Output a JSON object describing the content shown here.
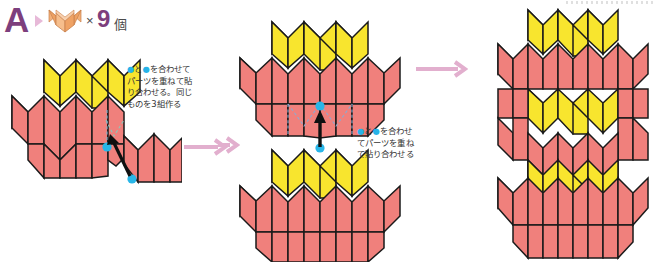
{
  "header": {
    "step_letter": "A",
    "arrow_icon": "triangle-right-icon",
    "unit_icon": "origami-unit-orange-icon",
    "multiply_sign": "×",
    "count": "9",
    "counter_suffix": "個"
  },
  "panels": [
    {
      "id": "panel-1",
      "name": "step-1-diagram",
      "description": "Three units joined: one yellow unit row overlapped on red units, with a loose red unit to the right",
      "callout": {
        "lines": [
          "●と●を合わせて",
          "パーツを重ねて貼",
          "り合わせる。同じ",
          "ものを 3 組作る"
        ],
        "full_text": "●と●を合わせてパーツを重ねて貼り合わせる。同じものを3組作る"
      },
      "markers": {
        "dot_color": "#29b6e8",
        "dot_count": 2,
        "assembly_arrow": "black-assembly-arrow"
      }
    },
    {
      "id": "panel-2",
      "name": "step-2-diagram",
      "description": "Two identical assembled groups stacked vertically, joined by a black arrow between two cyan dots",
      "callout": {
        "lines": [
          "●と●を合わせ",
          "てパーツを重ね",
          "て貼り合わせる"
        ],
        "full_text": "●と●を合わせてパーツを重ねて貼り合わせる"
      },
      "markers": {
        "dot_color": "#29b6e8",
        "dot_count": 2,
        "assembly_arrow": "black-assembly-arrow"
      }
    },
    {
      "id": "panel-3",
      "name": "step-3-result-diagram",
      "description": "Completed larger assembly of yellow and red units",
      "callout": null,
      "markers": null
    }
  ],
  "flow_arrows": [
    {
      "name": "flow-arrow-1",
      "direction": "right"
    },
    {
      "name": "flow-arrow-2",
      "direction": "right"
    },
    {
      "name": "flow-arrow-3",
      "direction": "right"
    }
  ],
  "colors": {
    "yellow_unit": "#F8E52E",
    "red_unit": "#F0807C",
    "orange_unit": "#F0A868",
    "orange_unit_light": "#F8C89A",
    "outline": "#1a1a1a",
    "marker_dot": "#29b6e8",
    "flow_arrow": "#E2AFCE",
    "letter_purple": "#7D3F7D",
    "text": "#333333",
    "background": "#FFFFFF",
    "guide_dash": "#8fb8cf"
  }
}
